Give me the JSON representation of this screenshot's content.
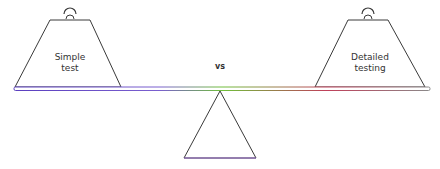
{
  "diagram": {
    "left_weight": {
      "line1": "Simple",
      "line2": "test"
    },
    "right_weight": {
      "line1": "Detailed",
      "line2": "testing"
    },
    "center_label": "vs",
    "colors": {
      "outline": "#3a3a3a",
      "beam_left": "#5a3fbf",
      "beam_center": "#6fbf3a",
      "beam_right": "#c0405a"
    }
  }
}
